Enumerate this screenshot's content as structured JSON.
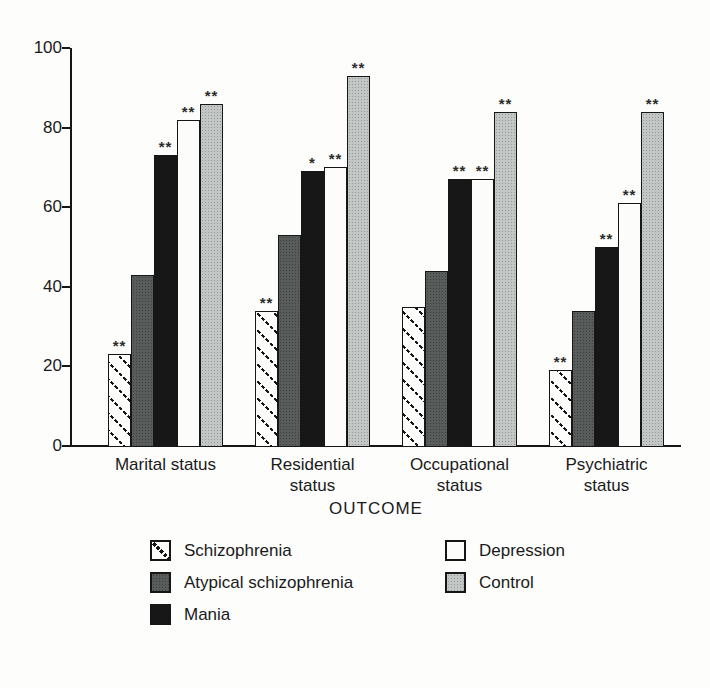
{
  "chart_data": {
    "type": "bar",
    "title": "",
    "xlabel": "OUTCOME",
    "ylabel": "",
    "ylim": [
      0,
      100
    ],
    "yticks": [
      0,
      20,
      40,
      60,
      80,
      100
    ],
    "grid": false,
    "categories": [
      "Marital status",
      "Residential status",
      "Occupational status",
      "Psychiatric status"
    ],
    "series": [
      {
        "name": "Schizophrenia",
        "pattern": "diagonal-hatch",
        "color": "#fdfdfc",
        "values": [
          23,
          34,
          35,
          19
        ],
        "annotations": [
          "**",
          "**",
          "",
          "**"
        ]
      },
      {
        "name": "Atypical schizophrenia",
        "pattern": "dark-dots",
        "color": "#585d5c",
        "values": [
          43,
          53,
          44,
          34
        ],
        "annotations": [
          "",
          "",
          "",
          ""
        ]
      },
      {
        "name": "Mania",
        "pattern": "solid",
        "color": "#171717",
        "values": [
          73,
          69,
          67,
          50
        ],
        "annotations": [
          "**",
          "*",
          "**",
          "**"
        ]
      },
      {
        "name": "Depression",
        "pattern": "solid",
        "color": "#fcfcfb",
        "values": [
          82,
          70,
          67,
          61
        ],
        "annotations": [
          "**",
          "**",
          "**",
          "**"
        ]
      },
      {
        "name": "Control",
        "pattern": "light-dots",
        "color": "#c2c6c5",
        "values": [
          86,
          93,
          84,
          84
        ],
        "annotations": [
          "**",
          "**",
          "**",
          "**"
        ]
      }
    ],
    "legend_position": "bottom",
    "legend_columns": [
      [
        "Schizophrenia",
        "Atypical schizophrenia",
        "Mania"
      ],
      [
        "Depression",
        "Control"
      ]
    ]
  },
  "style": {
    "background": "#fdfdfb",
    "axis_color": "#161616",
    "text_color": "#1a1a1a"
  }
}
